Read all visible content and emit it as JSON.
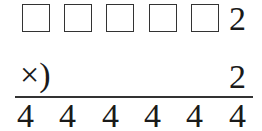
{
  "puzzle": {
    "multiplicand": {
      "blanks": 5,
      "last_digit": "2"
    },
    "multiplier": {
      "operator": "×)",
      "digit": "2"
    },
    "product": [
      "4",
      "4",
      "4",
      "4",
      "4",
      "4"
    ]
  }
}
